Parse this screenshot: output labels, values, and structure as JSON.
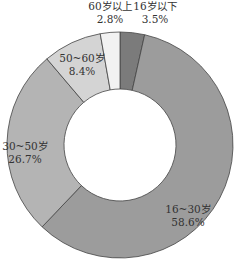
{
  "chart_data": {
    "type": "pie",
    "variant": "donut",
    "title": "",
    "start_angle_deg": 0,
    "direction": "clockwise",
    "slices": [
      {
        "label": "16岁以下",
        "value": 3.5,
        "value_label": "3.5%",
        "color": "#7b7b7b"
      },
      {
        "label": "16~30岁",
        "value": 58.6,
        "value_label": "58.6%",
        "color": "#9c9c9c"
      },
      {
        "label": "30~50岁",
        "value": 26.7,
        "value_label": "26.7%",
        "color": "#b4b4b4"
      },
      {
        "label": "50~60岁",
        "value": 8.4,
        "value_label": "8.4%",
        "color": "#d4d4d4"
      },
      {
        "label": "60岁以上",
        "value": 2.8,
        "value_label": "2.8%",
        "color": "#f2f2f2"
      }
    ],
    "legend": "none",
    "data_labels": "category and percent"
  }
}
